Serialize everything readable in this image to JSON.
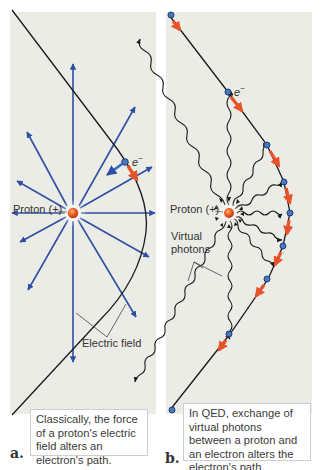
{
  "panel_a": {
    "letter": "a.",
    "proton_label": "Proton (+)",
    "electron_label": "e",
    "electron_charge": "−",
    "field_label": "Electric field",
    "caption": "Classically, the force of a proton's electric field alters an electron's path."
  },
  "panel_b": {
    "letter": "b.",
    "proton_label": "Proton (+)",
    "electron_label": "e",
    "electron_charge": "−",
    "photons_label_line1": "Virtual",
    "photons_label_line2": "photons",
    "caption": "In QED, exchange of virtual photons between a proton and an electron alters the electron's path."
  },
  "colors": {
    "panel_background": "#ecece7",
    "field_arrow": "#2e4fa3",
    "path_line": "#1a1a1a",
    "force_arrow": "#e8532a",
    "proton": "#e5541f",
    "electron": "#4a78c0",
    "caption_border": "#c9cfd4"
  }
}
